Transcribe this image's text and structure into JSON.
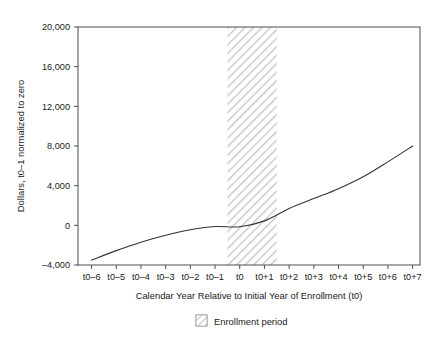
{
  "chart_data": {
    "type": "line",
    "title": "",
    "xlabel": "Calendar Year Relative to Initial Year of Enrollment (t0)",
    "ylabel": "Dollars, t0–1 normalized to zero",
    "categories": [
      "t0–6",
      "t0–5",
      "t0–4",
      "t0–3",
      "t0–2",
      "t0–1",
      "t0",
      "t0+1",
      "t0+2",
      "t0+3",
      "t0+4",
      "t0+5",
      "t0+6",
      "t0+7"
    ],
    "x": [
      -6,
      -5,
      -4,
      -3,
      -2,
      -1,
      0,
      1,
      2,
      3,
      4,
      5,
      6,
      7
    ],
    "series": [
      {
        "name": "Dollars",
        "values": [
          -3500,
          -2550,
          -1700,
          -1000,
          -450,
          -120,
          -150,
          450,
          1700,
          2700,
          3700,
          4900,
          6400,
          8000
        ]
      }
    ],
    "ylim": [
      -4000,
      20000
    ],
    "yticks": [
      -4000,
      0,
      4000,
      8000,
      12000,
      16000,
      20000
    ],
    "yticklabels": [
      "–4,000",
      "0",
      "4,000",
      "8,000",
      "12,000",
      "16,000",
      "20,000"
    ],
    "xlim": [
      -6.55,
      7.3
    ],
    "grid": false,
    "legend_position": "below-center",
    "legend": [
      {
        "label": "Enrollment period",
        "style": "hatched-band"
      }
    ],
    "annotations": [
      {
        "name": "enrollment-period-band",
        "type": "vertical-band",
        "x_start": -0.5,
        "x_end": 1.5,
        "fill": "hatch-diagonal",
        "color": "#c8c8c8"
      }
    ],
    "colors": {
      "line": "#333333",
      "frame": "#4d4d4d",
      "hatch": "#c8c8c8",
      "text": "#1a1a1a",
      "background": "#ffffff"
    }
  }
}
